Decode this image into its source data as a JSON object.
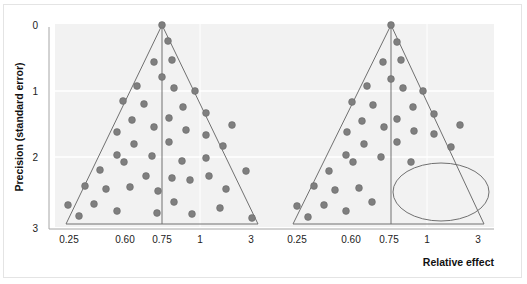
{
  "chart_data": [
    {
      "type": "scatter",
      "subtype": "funnel-plot",
      "title": "",
      "panel": "left",
      "xlabel": "",
      "ylabel": "Precision (standard error)",
      "x_tick_labels": [
        "0.25",
        "0.60",
        "0.75",
        "1",
        "3"
      ],
      "y_tick_labels": [
        "0",
        "1",
        "2",
        "3"
      ],
      "ylim": [
        0,
        3
      ],
      "y_inverted": true,
      "x_scale": "log",
      "pooled_effect": 0.75,
      "grid": {
        "horizontal": [
          1,
          2
        ],
        "vertical": [
          1
        ]
      },
      "funnel": {
        "apex": [
          0.75,
          0
        ],
        "base_left": 0.25,
        "base_right": 3,
        "base_se": 3
      },
      "points_px": [
        [
          162,
          25
        ],
        [
          168,
          41
        ],
        [
          154,
          62
        ],
        [
          172,
          60
        ],
        [
          162,
          77
        ],
        [
          137,
          86
        ],
        [
          174,
          88
        ],
        [
          195,
          91
        ],
        [
          123,
          101
        ],
        [
          144,
          104
        ],
        [
          183,
          107
        ],
        [
          206,
          113
        ],
        [
          132,
          120
        ],
        [
          154,
          127
        ],
        [
          169,
          118
        ],
        [
          232,
          125
        ],
        [
          186,
          130
        ],
        [
          117,
          132
        ],
        [
          206,
          135
        ],
        [
          134,
          144
        ],
        [
          169,
          142
        ],
        [
          223,
          146
        ],
        [
          117,
          155
        ],
        [
          152,
          156
        ],
        [
          124,
          162
        ],
        [
          182,
          161
        ],
        [
          206,
          158
        ],
        [
          100,
          170
        ],
        [
          146,
          176
        ],
        [
          172,
          178
        ],
        [
          190,
          180
        ],
        [
          209,
          176
        ],
        [
          246,
          171
        ],
        [
          85,
          186
        ],
        [
          106,
          189
        ],
        [
          130,
          187
        ],
        [
          158,
          191
        ],
        [
          226,
          189
        ],
        [
          68,
          205
        ],
        [
          94,
          204
        ],
        [
          117,
          211
        ],
        [
          174,
          202
        ],
        [
          220,
          208
        ],
        [
          79,
          216
        ],
        [
          157,
          213
        ],
        [
          192,
          214
        ],
        [
          252,
          218
        ]
      ],
      "description": "Symmetric funnel plot: studies scattered evenly on both sides of pooled estimate"
    },
    {
      "type": "scatter",
      "subtype": "funnel-plot",
      "title": "",
      "panel": "right",
      "xlabel": "Relative effect",
      "ylabel": "",
      "x_tick_labels": [
        "0.25",
        "0.60",
        "0.75",
        "1",
        "3"
      ],
      "ylim": [
        0,
        3
      ],
      "y_inverted": true,
      "x_scale": "log",
      "pooled_effect": 0.75,
      "grid": {
        "horizontal": [
          1,
          2
        ],
        "vertical": [
          1
        ]
      },
      "funnel": {
        "apex": [
          0.75,
          0
        ],
        "base_left": 0.25,
        "base_right": 3,
        "base_se": 3
      },
      "points_px": [
        [
          391,
          25
        ],
        [
          397,
          42
        ],
        [
          383,
          62
        ],
        [
          401,
          60
        ],
        [
          391,
          79
        ],
        [
          367,
          86
        ],
        [
          403,
          88
        ],
        [
          423,
          91
        ],
        [
          352,
          102
        ],
        [
          373,
          105
        ],
        [
          413,
          107
        ],
        [
          434,
          114
        ],
        [
          362,
          121
        ],
        [
          384,
          127
        ],
        [
          397,
          119
        ],
        [
          460,
          125
        ],
        [
          414,
          131
        ],
        [
          347,
          132
        ],
        [
          434,
          134
        ],
        [
          364,
          144
        ],
        [
          397,
          142
        ],
        [
          451,
          147
        ],
        [
          346,
          155
        ],
        [
          381,
          157
        ],
        [
          353,
          162
        ],
        [
          411,
          162
        ],
        [
          329,
          171
        ],
        [
          314,
          186
        ],
        [
          335,
          190
        ],
        [
          359,
          188
        ],
        [
          297,
          206
        ],
        [
          324,
          205
        ],
        [
          372,
          202
        ],
        [
          308,
          217
        ],
        [
          346,
          211
        ]
      ],
      "annotation": {
        "shape": "ellipse",
        "meaning": "missing small studies (publication bias)",
        "cx": 441,
        "cy": 192,
        "rx": 48,
        "ry": 29
      },
      "description": "Asymmetric funnel plot: small studies missing from bottom-right region"
    }
  ],
  "axes": {
    "y_title": "Precision (standard error)",
    "x_title": "Relative effect",
    "y_ticks": [
      {
        "label": "0",
        "y": 29
      },
      {
        "label": "1",
        "y": 95
      },
      {
        "label": "2",
        "y": 161
      },
      {
        "label": "3",
        "y": 232
      }
    ],
    "x_ticks_left": [
      {
        "label": "0.25",
        "x": 69
      },
      {
        "label": "0.60",
        "x": 125
      },
      {
        "label": "0.75",
        "x": 162
      },
      {
        "label": "1",
        "x": 200
      },
      {
        "label": "3",
        "x": 251
      }
    ],
    "x_ticks_right": [
      {
        "label": "0.25",
        "x": 297
      },
      {
        "label": "0.60",
        "x": 351
      },
      {
        "label": "0.75",
        "x": 389
      },
      {
        "label": "1",
        "x": 427
      },
      {
        "label": "3",
        "x": 478
      }
    ]
  },
  "colors": {
    "plot_bg": "#f2f2f2",
    "grid": "#ffffff",
    "funnel_line": "#707070",
    "dot": "#7f7f7f",
    "dot_stroke": "#6a6a6a",
    "axis": "#a6a6a6",
    "ellipse": "#707070"
  }
}
